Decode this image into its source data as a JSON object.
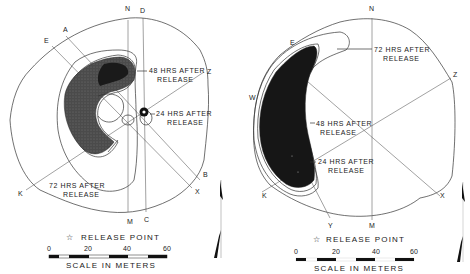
{
  "panels": [
    {
      "id": "left",
      "axis_labels": {
        "N": "N",
        "D": "D",
        "A": "A",
        "E": "E",
        "Z": "Z",
        "B": "B",
        "X": "X",
        "C": "C",
        "M": "M",
        "K": "K"
      },
      "annotations": {
        "h48_line1": "48 HRS AFTER",
        "h48_line2": "RELEASE",
        "h24_line1": "24 HRS AFTER",
        "h24_line2": "RELEASE",
        "h72_line1": "72 HRS AFTER",
        "h72_line2": "RELEASE"
      },
      "legend": {
        "release_point": "RELEASE POINT",
        "release_icon": "star-icon"
      },
      "scale": {
        "ticks": [
          "0",
          "20",
          "40",
          "60"
        ],
        "caption": "SCALE IN METERS"
      }
    },
    {
      "id": "right",
      "axis_labels": {
        "N": "N",
        "E": "E",
        "Z": "Z",
        "W": "W",
        "K": "K",
        "Y": "Y",
        "M": "M",
        "X": "X"
      },
      "annotations": {
        "h72_line1": "72 HRS AFTER",
        "h72_line2": "RELEASE",
        "h48_line1": "48 HRS AFTER",
        "h48_line2": "RELEASE",
        "h24_line1": "24 HRS AFTER",
        "h24_line2": "RELEASE"
      },
      "legend": {
        "release_point": "RELEASE POINT",
        "release_icon": "star-icon"
      },
      "scale": {
        "ticks": [
          "0",
          "20",
          "40",
          "60"
        ],
        "caption": "SCALE IN METERS"
      }
    }
  ],
  "colors": {
    "ink": "#222222",
    "plume_dark": "#1a1a1a",
    "plume_mid": "#4a4a4a",
    "background": "#ffffff"
  }
}
